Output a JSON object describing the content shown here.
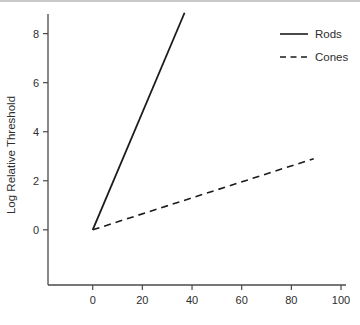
{
  "figure": {
    "background": "#ffffff",
    "scan_border_color": "#c9c9c9",
    "axis_color": "#4a4a4a",
    "line_color": "#1b1b1b",
    "text_color": "#2e2e2e"
  },
  "chart_data": {
    "type": "line",
    "title": "",
    "xlabel": "",
    "ylabel": "Log Relative Threshold",
    "x_ticks": [
      0,
      20,
      40,
      60,
      80,
      100
    ],
    "y_ticks": [
      0,
      2,
      4,
      6,
      8
    ],
    "xlim": [
      -18,
      102
    ],
    "ylim": [
      -2.25,
      8.8
    ],
    "grid": false,
    "legend_position": "top-right",
    "legend": [
      {
        "label": "Rods",
        "line_style": "solid"
      },
      {
        "label": "Cones",
        "line_style": "dashed"
      }
    ],
    "series": [
      {
        "name": "Rods",
        "line_style": "solid",
        "points": [
          [
            0,
            0
          ],
          [
            37,
            8.85
          ]
        ]
      },
      {
        "name": "Cones",
        "line_style": "dashed",
        "points": [
          [
            0,
            0
          ],
          [
            89,
            2.9
          ]
        ]
      }
    ]
  }
}
